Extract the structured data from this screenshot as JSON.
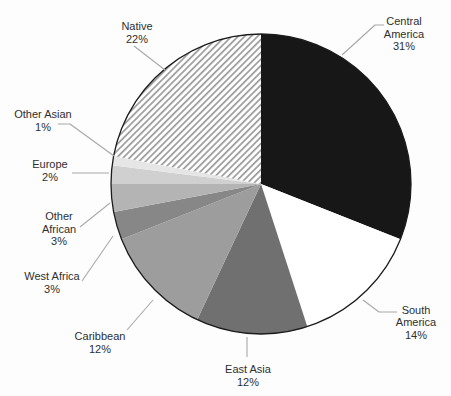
{
  "figure": {
    "background": "#fdfdfd",
    "outline_color": "#1c1c1c",
    "leader_line_color": "#a8a8a8",
    "text_color": "#2f2f2f"
  },
  "chart_data": {
    "type": "pie",
    "title": "",
    "unit": "%",
    "start_angle_deg": 0,
    "direction": "clockwise",
    "legend_position": "none",
    "labels_style": "outside-with-leader-lines",
    "slices": [
      {
        "id": "central-america",
        "label": "Central America",
        "value": 31,
        "display_lines": [
          "Central",
          "America",
          "31%"
        ],
        "fill": "#171717"
      },
      {
        "id": "south-america",
        "label": "South America",
        "value": 14,
        "display_lines": [
          "South",
          "America",
          "14%"
        ],
        "fill": "#ffffff"
      },
      {
        "id": "east-asia",
        "label": "East Asia",
        "value": 12,
        "display_lines": [
          "East Asia",
          "12%"
        ],
        "fill": "#707070"
      },
      {
        "id": "caribbean",
        "label": "Caribbean",
        "value": 12,
        "display_lines": [
          "Caribbean",
          "12%"
        ],
        "fill": "#9d9d9d"
      },
      {
        "id": "west-africa",
        "label": "West Africa",
        "value": 3,
        "display_lines": [
          "West Africa",
          "3%"
        ],
        "fill": "#878787"
      },
      {
        "id": "other-african",
        "label": "Other African",
        "value": 3,
        "display_lines": [
          "Other",
          "African",
          "3%"
        ],
        "fill": "#b4b4b4"
      },
      {
        "id": "europe",
        "label": "Europe",
        "value": 2,
        "display_lines": [
          "Europe",
          "2%"
        ],
        "fill": "#d0d0d0"
      },
      {
        "id": "other-asian",
        "label": "Other Asian",
        "value": 1,
        "display_lines": [
          "Other Asian",
          "1%"
        ],
        "fill": "#e6e6e6"
      },
      {
        "id": "native",
        "label": "Native",
        "value": 22,
        "display_lines": [
          "Native",
          "22%"
        ],
        "fill": "pattern:diagonal-hatch",
        "hatch": {
          "background": "#ffffff",
          "line_color": "#9b9b9b"
        }
      }
    ]
  }
}
